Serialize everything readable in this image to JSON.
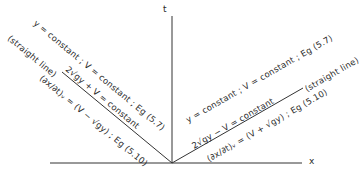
{
  "axes": {
    "vertical_label": "t",
    "horizontal_label": "x"
  },
  "left_characteristic": {
    "line1": "y = constant   ;   V = constant   ;   Eg (5.7)",
    "line2_prefix": "(straight line)",
    "line2": "2√gy + V = constant",
    "line3": "(∂x/∂t)ᵥ = (V − √gy)   ;   Eg (5.10)"
  },
  "right_characteristic": {
    "line1": "y = constant   ;   V = constant   ;   Eg (5.7)",
    "line2": "2√gy − V = constant",
    "line3": "(∂x/∂t)ᵥ = (V + √gy)   ;   Eg (5.10)",
    "line_suffix": "(straight line)"
  },
  "caption_partial": "... (a) Right-moving ... characteristics ... left"
}
